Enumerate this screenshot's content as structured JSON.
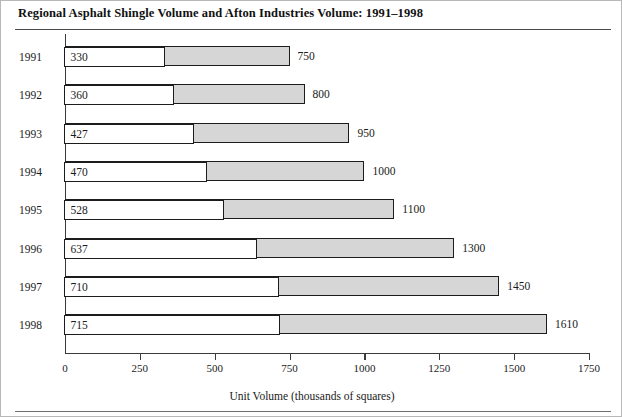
{
  "chart_data": {
    "type": "bar",
    "orientation": "horizontal",
    "subtype": "overlapped-bar",
    "title": "Regional Asphalt Shingle Volume and Afton Industries Volume: 1991–1998",
    "xlabel": "Unit Volume (thousands of squares)",
    "ylabel": "",
    "categories": [
      "1991",
      "1992",
      "1993",
      "1994",
      "1995",
      "1996",
      "1997",
      "1998"
    ],
    "series": [
      {
        "name": "Afton Industries Volume",
        "fill": "#ffffff",
        "values": [
          330,
          360,
          427,
          470,
          528,
          637,
          710,
          715
        ]
      },
      {
        "name": "Regional Asphalt Shingle Volume",
        "fill": "#d6d6d6",
        "values": [
          750,
          800,
          950,
          1000,
          1100,
          1300,
          1450,
          1610
        ]
      }
    ],
    "xlim": [
      0,
      1750
    ],
    "xticks": [
      0,
      250,
      500,
      750,
      1000,
      1250,
      1500,
      1750
    ],
    "xtick_labels": [
      "0",
      "250",
      "500",
      "750",
      "1000",
      "1250",
      "1500",
      "1750"
    ],
    "grid": false,
    "legend": "none",
    "colors": {
      "inner_fill": "#ffffff",
      "outer_fill": "#d6d6d6",
      "bar_stroke": "#1c1c1c",
      "axis": "#3a3a3a",
      "text": "#1a1a1a",
      "rule": "#4a4a4a"
    }
  },
  "rows": [
    {
      "year": "1991",
      "inner": "330",
      "total": "750"
    },
    {
      "year": "1992",
      "inner": "360",
      "total": "800"
    },
    {
      "year": "1993",
      "inner": "427",
      "total": "950"
    },
    {
      "year": "1994",
      "inner": "470",
      "total": "1000"
    },
    {
      "year": "1995",
      "inner": "528",
      "total": "1100"
    },
    {
      "year": "1996",
      "inner": "637",
      "total": "1300"
    },
    {
      "year": "1997",
      "inner": "710",
      "total": "1450"
    },
    {
      "year": "1998",
      "inner": "715",
      "total": "1610"
    }
  ]
}
